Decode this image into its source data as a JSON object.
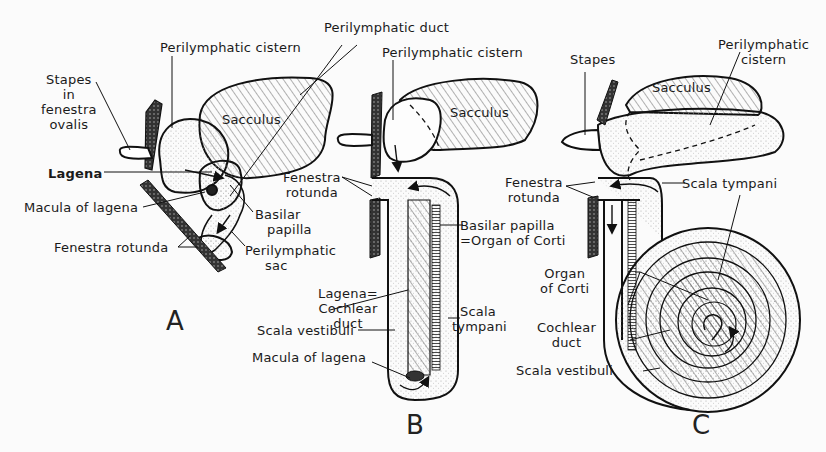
{
  "figure": {
    "panels": [
      {
        "id": "A",
        "letter": "A",
        "labels": {
          "stapes": [
            "Stapes",
            "in",
            "fenestra",
            "ovalis"
          ],
          "perilymphatic_cistern": "Perilymphatic cistern",
          "sacculus": "Sacculus",
          "lagena": "Lagena",
          "macula_of_lagena": "Macula of lagena",
          "basilar_papilla": [
            "Basilar",
            "papilla"
          ],
          "fenestra_rotunda": "Fenestra rotunda",
          "perilymphatic_sac": [
            "Perilymphatic",
            "sac"
          ]
        }
      },
      {
        "id": "B",
        "letter": "B",
        "labels": {
          "perilymphatic_duct": "Perilymphatic duct",
          "perilymphatic_cistern": "Perilymphatic cistern",
          "sacculus": "Sacculus",
          "fenestra_rotunda": [
            "Fenestra",
            "rotunda"
          ],
          "basilar_papilla": [
            "Basilar papilla",
            "=Organ of Corti"
          ],
          "lagena": [
            "Lagena=",
            "Cochlear",
            "duct"
          ],
          "scala_tympani": [
            "Scala",
            "tympani"
          ],
          "scala_vestibuli": "Scala vestibuli",
          "macula_of_lagena": "Macula of lagena"
        }
      },
      {
        "id": "C",
        "letter": "C",
        "labels": {
          "stapes": "Stapes",
          "perilymphatic_cistern": [
            "Perilymphatic",
            "cistern"
          ],
          "sacculus": "Sacculus",
          "fenestra_rotunda": [
            "Fenestra",
            "rotunda"
          ],
          "scala_tympani": "Scala tympani",
          "organ_of_corti": [
            "Organ",
            "of Corti"
          ],
          "cochlear_duct": [
            "Cochlear",
            "duct"
          ],
          "scala_vestibuli": "Scala vestibuli"
        }
      }
    ]
  }
}
